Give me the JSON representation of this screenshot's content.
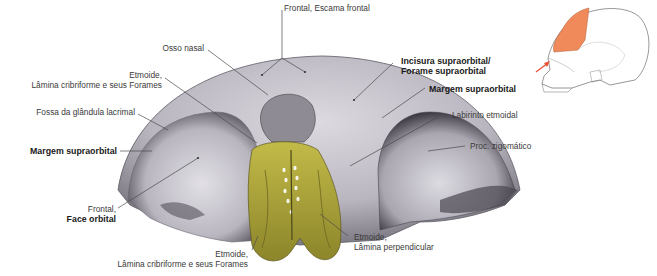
{
  "figure": {
    "colors": {
      "bone": "#c9c6cf",
      "bone_shadow": "#7e7b86",
      "ethmoid": "#b5ad3c",
      "highlight_region": "#f08a5a",
      "leader_line": "#4a4a4a",
      "arrow": "#e8533a"
    },
    "labels": {
      "frontal_escama": "Frontal, Escama frontal",
      "osso_nasal": "Osso nasal",
      "etmoide_lamina_top_1": "Etmoide,",
      "etmoide_lamina_top_2": "Lâmina cribriforme e seus Forames",
      "fossa_lacrimal": "Fossa da glândula lacrimal",
      "margem_left": "Margem supraorbital",
      "frontal_face_1": "Frontal,",
      "frontal_face_2": "Face orbital",
      "etmoide_bottom_1": "Etmoide,",
      "etmoide_bottom_2": "Lâmina cribriforme e seus Forames",
      "incisura_1": "Incisura supraorbital/",
      "incisura_2": "Forame supraorbital",
      "margem_right": "Margem supraorbital",
      "labirinto": "Labirinto etmoidal",
      "proc_zigomatico": "Proc. zigomático",
      "etmoide_perp_1": "Etmoide,",
      "etmoide_perp_2": "Lâmina perpendicular"
    },
    "inset": {
      "description": "Lateral skull with frontal bone highlighted",
      "view_arrow": "arrow-icon"
    }
  }
}
